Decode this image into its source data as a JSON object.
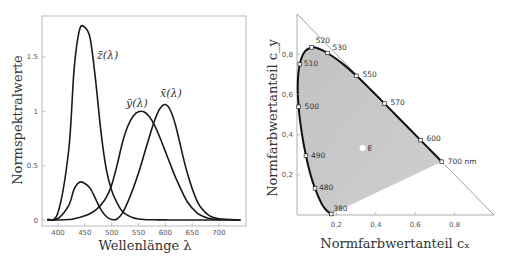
{
  "chart_data": [
    {
      "type": "line",
      "title": "",
      "xlabel": "Wellenlänge λ",
      "ylabel": "Normspektralwerte",
      "xlim": [
        380,
        740
      ],
      "ylim": [
        0,
        1.85
      ],
      "xticks": [
        "400",
        "450",
        "500",
        "550",
        "600",
        "650",
        "700"
      ],
      "yticks": [
        "0",
        "0.5",
        "1",
        "1.5"
      ],
      "grid": false,
      "x": [
        380,
        400,
        420,
        430,
        440,
        450,
        460,
        470,
        480,
        490,
        500,
        510,
        520,
        530,
        540,
        550,
        560,
        570,
        580,
        590,
        600,
        610,
        620,
        640,
        660,
        680,
        700,
        740
      ],
      "series": [
        {
          "name": "x̄(λ)",
          "label": "x̄(λ)",
          "values": [
            0.001,
            0.014,
            0.134,
            0.284,
            0.348,
            0.336,
            0.291,
            0.195,
            0.096,
            0.032,
            0.005,
            0.009,
            0.063,
            0.165,
            0.29,
            0.433,
            0.595,
            0.762,
            0.916,
            1.026,
            1.062,
            1.003,
            0.854,
            0.448,
            0.165,
            0.047,
            0.011,
            0.0
          ]
        },
        {
          "name": "ȳ(λ)",
          "label": "ȳ(λ)",
          "values": [
            0.0,
            0.0004,
            0.004,
            0.012,
            0.023,
            0.038,
            0.06,
            0.091,
            0.139,
            0.208,
            0.323,
            0.503,
            0.71,
            0.862,
            0.954,
            0.995,
            0.995,
            0.952,
            0.87,
            0.757,
            0.631,
            0.503,
            0.381,
            0.175,
            0.061,
            0.017,
            0.004,
            0.0
          ]
        },
        {
          "name": "z̄(λ)",
          "label": "z̄(λ)",
          "values": [
            0.006,
            0.068,
            0.646,
            1.386,
            1.747,
            1.772,
            1.669,
            1.288,
            0.813,
            0.465,
            0.272,
            0.158,
            0.078,
            0.042,
            0.02,
            0.009,
            0.004,
            0.002,
            0.002,
            0.001,
            0.001,
            0.0,
            0.0,
            0.0,
            0.0,
            0.0,
            0.0,
            0.0
          ]
        }
      ],
      "annotations": [
        "z̄(λ)",
        "ȳ(λ)",
        "x̄(λ)"
      ]
    },
    {
      "type": "scatter",
      "title": "",
      "xlabel": "Normfarbwertanteil c_x",
      "ylabel": "Normfarbwertanteil c_y",
      "xlim": [
        0,
        1
      ],
      "ylim": [
        0,
        1
      ],
      "xticks": [
        "0,2",
        "0,4",
        "0,6",
        "0,8"
      ],
      "yticks": [
        "0,2",
        "0,4",
        "0,6",
        "0,8"
      ],
      "grid": false,
      "series": [
        {
          "name": "Spektralfarbenzug",
          "points": [
            {
              "label": "380",
              "x": 0.1741,
              "y": 0.005
            },
            {
              "label": "480",
              "x": 0.0913,
              "y": 0.1327
            },
            {
              "label": "490",
              "x": 0.0454,
              "y": 0.295
            },
            {
              "label": "500",
              "x": 0.0082,
              "y": 0.5384
            },
            {
              "label": "510",
              "x": 0.0139,
              "y": 0.7502
            },
            {
              "label": "520",
              "x": 0.0743,
              "y": 0.8338
            },
            {
              "label": "530",
              "x": 0.1547,
              "y": 0.8059
            },
            {
              "label": "550",
              "x": 0.3016,
              "y": 0.6923
            },
            {
              "label": "570",
              "x": 0.4441,
              "y": 0.5547
            },
            {
              "label": "600",
              "x": 0.627,
              "y": 0.3725
            },
            {
              "label": "700 nm",
              "x": 0.7347,
              "y": 0.2653
            }
          ]
        },
        {
          "name": "Unbuntpunkt",
          "points": [
            {
              "label": "E",
              "x": 0.333,
              "y": 0.333
            }
          ]
        }
      ],
      "annotations": [
        "380",
        "480",
        "490",
        "500",
        "510",
        "520",
        "530",
        "550",
        "570",
        "600",
        "700 nm",
        "E"
      ]
    }
  ]
}
